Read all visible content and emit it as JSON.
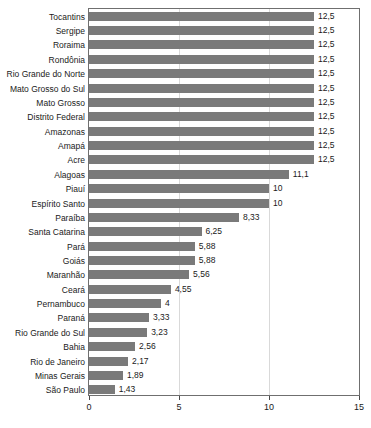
{
  "chart_data": {
    "type": "bar",
    "orientation": "horizontal",
    "title": "",
    "subtitle": "",
    "xlabel": "",
    "ylabel": "",
    "xlim": [
      0,
      15
    ],
    "xticks": [
      "0",
      "5",
      "10",
      "15"
    ],
    "xtick_values": [
      0,
      5,
      10,
      15
    ],
    "grid": "vertical-light",
    "legend": "none",
    "bar_color": "#7a7a7a",
    "decimal_separator": ",",
    "categories": [
      "Tocantins",
      "Sergipe",
      "Roraima",
      "Rondônia",
      "Rio Grande do Norte",
      "Mato Grosso do Sul",
      "Mato Grosso",
      "Distrito Federal",
      "Amazonas",
      "Amapá",
      "Acre",
      "Alagoas",
      "Piauí",
      "Espírito Santo",
      "Paraíba",
      "Santa Catarina",
      "Pará",
      "Goiás",
      "Maranhão",
      "Ceará",
      "Pernambuco",
      "Paraná",
      "Rio Grande do Sul",
      "Bahia",
      "Rio de Janeiro",
      "Minas Gerais",
      "São Paulo"
    ],
    "values": [
      12.5,
      12.5,
      12.5,
      12.5,
      12.5,
      12.5,
      12.5,
      12.5,
      12.5,
      12.5,
      12.5,
      11.1,
      10,
      10,
      8.33,
      6.25,
      5.88,
      5.88,
      5.56,
      4.55,
      4,
      3.33,
      3.23,
      2.56,
      2.17,
      1.89,
      1.43
    ],
    "value_labels": [
      "12,5",
      "12,5",
      "12,5",
      "12,5",
      "12,5",
      "12,5",
      "12,5",
      "12,5",
      "12,5",
      "12,5",
      "12,5",
      "11,1",
      "10",
      "10",
      "8,33",
      "6,25",
      "5,88",
      "5,88",
      "5,56",
      "4,55",
      "4",
      "3,33",
      "3,23",
      "2,56",
      "2,17",
      "1,89",
      "1,43"
    ]
  }
}
